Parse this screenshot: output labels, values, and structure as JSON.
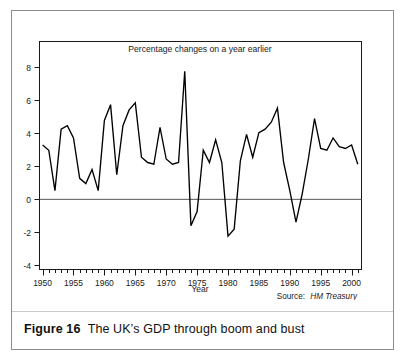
{
  "figure": {
    "caption_label": "Figure 16",
    "caption_text": "The UK’s GDP through boom and bust",
    "border_color": "#8d8d8d",
    "background": "#ffffff"
  },
  "chart_data": {
    "type": "line",
    "title": "Percentage changes on a year earlier",
    "xlabel": "Year",
    "ylabel": "",
    "source": "Source: HM Treasury",
    "source_prefix": "Source:",
    "source_name": "HM Treasury",
    "grid": false,
    "legend": "none",
    "line_color": "#000000",
    "zero_line_color": "#555555",
    "xlim": [
      1949.5,
      2001.6
    ],
    "ylim": [
      -4,
      9
    ],
    "yticks": [
      -4,
      -2,
      0,
      2,
      4,
      6,
      8
    ],
    "ytick_labels": [
      "-4",
      "-2",
      "0",
      "2",
      "4",
      "6",
      "8"
    ],
    "xticks": [
      1950,
      1955,
      1960,
      1965,
      1970,
      1975,
      1980,
      1985,
      1990,
      1995,
      2000
    ],
    "xtick_labels": [
      "1950",
      "1955",
      "1960",
      "1965",
      "1970",
      "1975",
      "1980",
      "1985",
      "1990",
      "1995",
      "2000"
    ],
    "xtick_minor_step": 1,
    "x": [
      1950,
      1951,
      1952,
      1953,
      1954,
      1955,
      1956,
      1957,
      1958,
      1959,
      1960,
      1961,
      1962,
      1963,
      1964,
      1965,
      1966,
      1967,
      1968,
      1969,
      1970,
      1971,
      1972,
      1973,
      1974,
      1975,
      1976,
      1977,
      1978,
      1979,
      1980,
      1981,
      1982,
      1983,
      1984,
      1985,
      1986,
      1987,
      1988,
      1989,
      1990,
      1991,
      1992,
      1993,
      1994,
      1995,
      1996,
      1997,
      1998,
      1999,
      2000,
      2001
    ],
    "values": [
      3.1,
      2.8,
      0.5,
      4.0,
      4.2,
      3.5,
      1.2,
      0.9,
      1.7,
      0.5,
      4.5,
      5.4,
      1.4,
      4.2,
      5.1,
      5.5,
      2.4,
      2.1,
      2.0,
      4.1,
      2.3,
      2.0,
      2.1,
      7.3,
      -1.5,
      -0.7,
      2.8,
      2.1,
      3.4,
      2.1,
      -2.1,
      -1.7,
      2.2,
      3.7,
      2.4,
      3.8,
      4.0,
      4.4,
      5.2,
      2.1,
      0.5,
      -1.3,
      0.3,
      2.3,
      4.6,
      2.9,
      2.8,
      3.5,
      3.0,
      2.9,
      3.1,
      2.0
    ],
    "series_name": "UK GDP annual percentage change"
  }
}
